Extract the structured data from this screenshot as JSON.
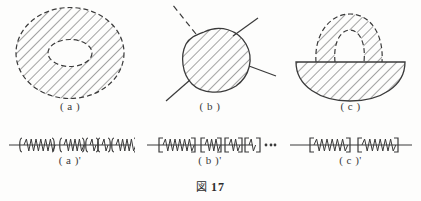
{
  "caption": {
    "mark": "図",
    "number": "17"
  },
  "shapes": [
    {
      "id": "annulus",
      "label": "( a )",
      "description": "dashed-outline annulus with diagonal hatching",
      "outer_boundary": "dashed",
      "inner_boundary": "dashed",
      "hatch": "diagonal"
    },
    {
      "id": "blob-with-arcs",
      "label": "( b )",
      "description": "hatched blob with four radiating arcs, one dashed",
      "outer_boundary": "solid",
      "arcs": [
        "dashed",
        "solid",
        "solid",
        "solid"
      ],
      "hatch": "diagonal"
    },
    {
      "id": "half-disk-with-arch",
      "label": "( c )",
      "description": "solid half-disk with dashed arch handle on top",
      "outer_boundary": "solid",
      "arch_boundary": "dashed",
      "hatch": "diagonal"
    }
  ],
  "line_diagrams": [
    {
      "id": "line-a",
      "label": "( a )'",
      "groups": [
        {
          "bracket": "paren",
          "coils": 6,
          "width": 30
        },
        {
          "bracket": "paren",
          "coils": 4,
          "width": 20
        },
        {
          "bracket": "paren",
          "coils": 1,
          "width": 8
        },
        {
          "bracket": "paren",
          "coils": 1,
          "width": 8
        },
        {
          "bracket": "paren",
          "coils": 4,
          "width": 20
        }
      ],
      "trailing_dots": 0
    },
    {
      "id": "line-b",
      "label": "( b )'",
      "groups": [
        {
          "bracket": "square",
          "coils": 6,
          "width": 30
        },
        {
          "bracket": "square",
          "coils": 3,
          "width": 16
        },
        {
          "bracket": "square",
          "coils": 2,
          "width": 13
        },
        {
          "bracket": "square",
          "coils": 1,
          "width": 9
        }
      ],
      "trailing_dots": 3
    },
    {
      "id": "line-c",
      "label": "( c )'",
      "groups": [
        {
          "bracket": "square",
          "coils": 6,
          "width": 32
        },
        {
          "bracket": "square",
          "coils": 6,
          "width": 32
        }
      ],
      "trailing_dots": 0
    }
  ],
  "colors": {
    "ink": "#3a3a3a",
    "paper": "#fdfdfc"
  }
}
